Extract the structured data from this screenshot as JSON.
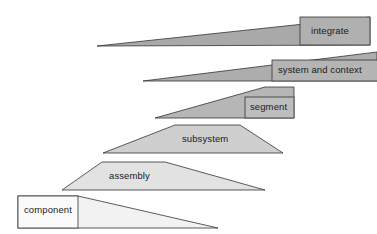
{
  "diagram": {
    "title": "",
    "type": "hierarchy-wedge-stack",
    "background_color": "#ffffff",
    "stroke_color": "#333333",
    "label_text_color": "#1a1a1a",
    "levels": [
      {
        "id": "integrate",
        "label": "integrate",
        "order": 1,
        "fill": "#a9a9a9",
        "label_box_fill": "#b0b0b0",
        "wedge_points": "97,46 370,17 370,45 97,46",
        "label_box": {
          "x": 300,
          "y": 17,
          "w": 70,
          "h": 28
        },
        "label_pos": {
          "x": 311,
          "y": 27
        }
      },
      {
        "id": "system-and-context",
        "label": "system and context",
        "order": 2,
        "fill": "#adadad",
        "label_box_fill": "#b4b4b4",
        "wedge_points": "143,81 377,52 377,81 143,81",
        "label_box": {
          "x": 272,
          "y": 60,
          "w": 105,
          "h": 21
        },
        "label_pos": {
          "x": 278,
          "y": 66
        }
      },
      {
        "id": "segment",
        "label": "segment",
        "order": 3,
        "fill": "#b6b6b6",
        "label_box_fill": "#bdbdbd",
        "wedge_points": "155,118 265,87 294,87 294,118 155,118",
        "label_box": {
          "x": 245,
          "y": 97,
          "w": 49,
          "h": 21
        },
        "label_pos": {
          "x": 250,
          "y": 103
        }
      },
      {
        "id": "subsystem",
        "label": "subsystem",
        "order": 4,
        "fill": "#cfcfcf",
        "label_box_fill": "#d4d4d4",
        "wedge_points": "103,153 175,125 240,125 283,153 103,153",
        "label_box": {
          "x": 178,
          "y": 130,
          "w": 67,
          "h": 20
        },
        "label_pos": {
          "x": 183,
          "y": 135
        }
      },
      {
        "id": "assembly",
        "label": "assembly",
        "order": 5,
        "fill": "#e2e2e2",
        "label_box_fill": "#e6e6e6",
        "wedge_points": "62,190 102,162 165,162 265,190 62,190",
        "label_box": {
          "x": 105,
          "y": 167,
          "w": 60,
          "h": 20
        },
        "label_pos": {
          "x": 110,
          "y": 172
        }
      },
      {
        "id": "component",
        "label": "component",
        "order": 6,
        "fill": "#f2f2f2",
        "label_box_fill": "#fafafa",
        "wedge_points": "18,228 18,196 78,196 218,228 18,228",
        "label_box": {
          "x": 18,
          "y": 196,
          "w": 60,
          "h": 32
        },
        "label_pos": {
          "x": 24,
          "y": 206
        }
      }
    ]
  }
}
